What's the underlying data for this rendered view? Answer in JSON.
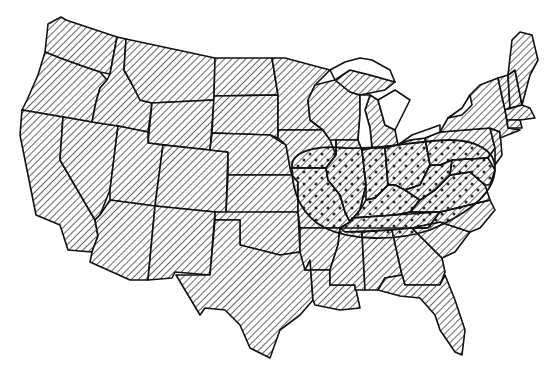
{
  "map": {
    "subject": "Contiguous United States",
    "style": "black and white line map",
    "background_color": "#ffffff",
    "line_color": "#111111",
    "fill_pattern": "diagonal-hatch",
    "highlight_pattern": "dot-stipple",
    "highlighted_region": {
      "description": "Oval dotted region over the Ohio Valley / Mid-Atlantic",
      "states_covered": [
        "Missouri (east)",
        "Iowa (southeast)",
        "Illinois",
        "Indiana",
        "Ohio",
        "Kentucky",
        "Tennessee (north)",
        "West Virginia",
        "Virginia",
        "Pennsylvania (south)",
        "Maryland",
        "Delaware"
      ]
    },
    "text_labels": []
  }
}
